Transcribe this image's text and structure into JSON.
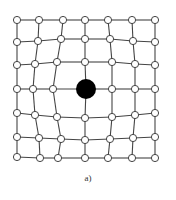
{
  "figure": {
    "caption": "a)",
    "colors": {
      "line": "#444444",
      "node_fill": "#ffffff",
      "node_stroke": "#444444",
      "center_fill": "#000000"
    },
    "node_radius": 3.6,
    "center_node": {
      "x": 86,
      "y": 89,
      "r": 10
    },
    "rows": [
      [
        [
          17,
          20
        ],
        [
          39,
          20
        ],
        [
          63,
          20
        ],
        [
          85,
          20
        ],
        [
          108,
          20
        ],
        [
          132,
          20
        ],
        [
          155,
          20
        ]
      ],
      [
        [
          17,
          42
        ],
        [
          38,
          41
        ],
        [
          61,
          39
        ],
        [
          85,
          39
        ],
        [
          110,
          39
        ],
        [
          133,
          41
        ],
        [
          155,
          42
        ]
      ],
      [
        [
          17,
          65
        ],
        [
          35,
          64
        ],
        [
          57,
          62
        ],
        [
          85,
          62
        ],
        [
          112,
          62
        ],
        [
          135,
          64
        ],
        [
          155,
          65
        ]
      ],
      [
        [
          17,
          89
        ],
        [
          33,
          89
        ],
        [
          53,
          89
        ],
        [
          86,
          89
        ],
        [
          112,
          89
        ],
        [
          135,
          89
        ],
        [
          155,
          89
        ]
      ],
      [
        [
          17,
          113
        ],
        [
          35,
          115
        ],
        [
          57,
          117
        ],
        [
          85,
          118
        ],
        [
          112,
          117
        ],
        [
          135,
          115
        ],
        [
          155,
          113
        ]
      ],
      [
        [
          17,
          137
        ],
        [
          39,
          138
        ],
        [
          61,
          139
        ],
        [
          85,
          140
        ],
        [
          110,
          139
        ],
        [
          133,
          138
        ],
        [
          155,
          137
        ]
      ],
      [
        [
          17,
          157
        ],
        [
          40,
          158
        ],
        [
          58,
          158
        ],
        [
          85,
          158
        ],
        [
          108,
          158
        ],
        [
          132,
          158
        ],
        [
          155,
          158
        ]
      ]
    ]
  }
}
